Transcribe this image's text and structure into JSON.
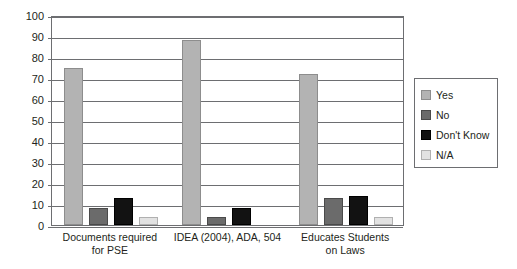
{
  "chart_data": {
    "type": "bar",
    "title": "",
    "xlabel": "",
    "ylabel": "",
    "ylim": [
      0,
      100
    ],
    "ytick_step": 10,
    "yticks": [
      "0",
      "10",
      "20",
      "30",
      "40",
      "50",
      "60",
      "70",
      "80",
      "90",
      "100"
    ],
    "grid": true,
    "legend_position": "right",
    "categories": [
      "Documents required for PSE",
      "IDEA (2004), ADA, 504",
      "Educates Students on Laws"
    ],
    "category_lines": [
      [
        "Documents required",
        "for PSE"
      ],
      [
        "IDEA (2004), ADA, 504"
      ],
      [
        "Educates Students",
        "on Laws"
      ]
    ],
    "series": [
      {
        "name": "Yes",
        "color": "#b3b3b3",
        "values": [
          75,
          88,
          72
        ]
      },
      {
        "name": "No",
        "color": "#6b6b6b",
        "values": [
          8,
          4,
          13
        ]
      },
      {
        "name": "Don't Know",
        "color": "#121212",
        "values": [
          13,
          8,
          14
        ]
      },
      {
        "name": "N/A",
        "color": "#e2e2e2",
        "values": [
          4,
          0,
          4
        ]
      }
    ]
  },
  "legend": {
    "items": [
      {
        "label": "Yes"
      },
      {
        "label": "No"
      },
      {
        "label": "Don't Know"
      },
      {
        "label": "N/A"
      }
    ]
  },
  "colors": {
    "axis": "#6d6e71",
    "text": "#231f20",
    "background": "#ffffff"
  }
}
